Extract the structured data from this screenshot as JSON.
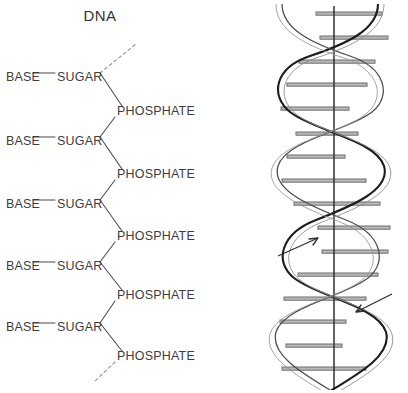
{
  "figure": {
    "title": "DNA",
    "background_color": "#ffffff",
    "ink_color": "#3a3a3a",
    "width": 408,
    "height": 393
  },
  "left_panel": {
    "name": "dna-backbone-chain-diagram",
    "description": "Zig-zag sugar-phosphate backbone with base side groups",
    "labels": {
      "base": "BASE",
      "sugar": "SUGAR",
      "phosphate": "PHOSPHATE"
    },
    "units": [
      {
        "base": "BASE",
        "sugar": "SUGAR",
        "base_y": 77,
        "phosphate": "PHOSPHATE",
        "phosphate_y": 111
      },
      {
        "base": "BASE",
        "sugar": "SUGAR",
        "base_y": 141,
        "phosphate": "PHOSPHATE",
        "phosphate_y": 174
      },
      {
        "base": "BASE",
        "sugar": "SUGAR",
        "base_y": 204,
        "phosphate": "PHOSPHATE",
        "phosphate_y": 236
      },
      {
        "base": "BASE",
        "sugar": "SUGAR",
        "base_y": 266,
        "phosphate": "PHOSPHATE",
        "phosphate_y": 295
      },
      {
        "base": "BASE",
        "sugar": "SUGAR",
        "base_y": 327,
        "phosphate": "PHOSPHATE",
        "phosphate_y": 356
      }
    ],
    "continuation": {
      "top": "dashed-line-continues-upward",
      "bottom": "dashed-line-continues-downward"
    }
  },
  "right_panel": {
    "name": "dna-double-helix-diagram",
    "description": "Right-handed double helix with horizontal base-pair rungs and central axis",
    "turns": 4,
    "rung_count": 16,
    "axis": "vertical-center-axis",
    "strand_direction_arrows": [
      {
        "id": "left-strand-arrow",
        "direction": "up",
        "meaning": "5-prime to 3-prime upward"
      },
      {
        "id": "right-strand-arrow",
        "direction": "down",
        "meaning": "3-prime to 5-prime downward"
      }
    ]
  }
}
